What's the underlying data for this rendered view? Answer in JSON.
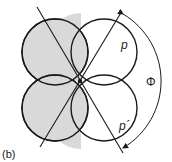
{
  "figure": {
    "panel_label": "(b)",
    "labels": {
      "p": "p",
      "p_prime": "p´",
      "phi": "Φ"
    },
    "colors": {
      "stroke": "#1a1a1a",
      "shaded_fill": "#d9d9d9",
      "background": "#ffffff"
    }
  }
}
